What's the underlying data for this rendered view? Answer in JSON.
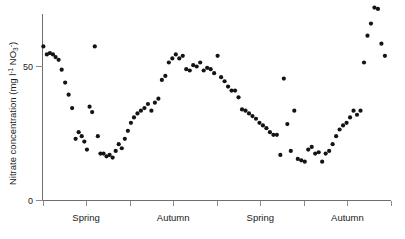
{
  "chart_data": {
    "type": "scatter",
    "title": "",
    "xlabel": "",
    "ylabel": "Nitrate concentration (mg l⁻¹ NO₃⁻)",
    "ylabel_parts": {
      "main": "Nitrate concentration (mg l",
      "sup1": "-1",
      "mid": " NO",
      "sub1": "3",
      "sup2": "-",
      "end": ")"
    },
    "ylim": [
      0,
      75
    ],
    "yticks": [
      0,
      50
    ],
    "ytick_labels": [
      "0",
      "50"
    ],
    "xlim": [
      0,
      8
    ],
    "xticks": [
      0,
      1,
      2,
      3,
      4,
      5,
      6,
      7,
      8
    ],
    "grid": false,
    "legend": null,
    "marker": "circle",
    "marker_color": "#141414",
    "marker_size": 2.1,
    "categories": [
      "Spring",
      "Autumn",
      "Spring",
      "Autumn"
    ],
    "category_positions": [
      1.0,
      3.0,
      5.0,
      7.0
    ],
    "series": [
      {
        "name": "Nitrate concentration",
        "x": [
          0.02,
          0.1,
          0.17,
          0.24,
          0.3,
          0.37,
          0.44,
          0.52,
          0.6,
          0.68,
          0.76,
          0.83,
          0.9,
          0.96,
          1.02,
          1.08,
          1.14,
          1.2,
          1.27,
          1.33,
          1.4,
          1.47,
          1.54,
          1.61,
          1.68,
          1.75,
          1.82,
          1.89,
          1.96,
          2.03,
          2.1,
          2.18,
          2.26,
          2.34,
          2.42,
          2.5,
          2.58,
          2.66,
          2.74,
          2.82,
          2.9,
          2.98,
          3.06,
          3.14,
          3.22,
          3.3,
          3.38,
          3.46,
          3.54,
          3.62,
          3.7,
          3.78,
          3.86,
          3.94,
          4.02,
          4.1,
          4.18,
          4.26,
          4.34,
          4.42,
          4.5,
          4.58,
          4.66,
          4.74,
          4.82,
          4.9,
          4.98,
          5.06,
          5.14,
          5.22,
          5.3,
          5.38,
          5.46,
          5.54,
          5.62,
          5.7,
          5.78,
          5.86,
          5.94,
          6.02,
          6.1,
          6.18,
          6.26,
          6.34,
          6.42,
          6.5,
          6.58,
          6.66,
          6.74,
          6.82,
          6.9,
          6.98,
          7.06,
          7.14,
          7.22,
          7.3,
          7.38,
          7.46,
          7.54,
          7.62,
          7.7,
          7.78,
          7.86
        ],
        "y": [
          57.5,
          54.5,
          55.0,
          54.5,
          53.5,
          52.5,
          48.8,
          44.0,
          39.5,
          34.5,
          23.0,
          25.5,
          24.0,
          22.0,
          19.0,
          35.0,
          33.0,
          57.5,
          24.0,
          17.5,
          17.5,
          16.5,
          17.0,
          16.0,
          18.5,
          21.0,
          19.5,
          23.0,
          26.0,
          29.0,
          31.0,
          32.5,
          33.5,
          34.5,
          36.0,
          33.5,
          36.5,
          38.0,
          45.0,
          46.5,
          51.5,
          53.0,
          54.5,
          53.0,
          54.0,
          49.0,
          48.5,
          50.5,
          50.0,
          51.5,
          48.5,
          49.5,
          49.0,
          47.5,
          54.0,
          46.0,
          44.5,
          42.5,
          41.0,
          41.0,
          38.5,
          34.0,
          33.5,
          32.5,
          31.5,
          30.5,
          29.0,
          28.0,
          27.0,
          25.5,
          24.5,
          24.5,
          17.0,
          45.5,
          28.5,
          18.5,
          33.5,
          15.5,
          15.0,
          14.5,
          19.0,
          20.0,
          17.5,
          18.0,
          14.5,
          17.5,
          18.5,
          21.0,
          24.0,
          26.5,
          28.0,
          29.0,
          31.0,
          33.5,
          32.0,
          33.5,
          51.5,
          61.5,
          66.0,
          72.0,
          71.5,
          58.5,
          54.0
        ]
      }
    ]
  },
  "axis": {
    "y_tick_0": "0",
    "y_tick_50": "50"
  }
}
